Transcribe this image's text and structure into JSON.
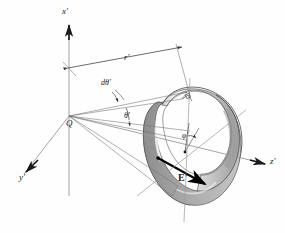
{
  "figure": {
    "background_color": "#fefefe",
    "line_color": "#4a4a4a",
    "dark_color": "#111111"
  },
  "axes": {
    "x_label": "x'",
    "y_label": "y'",
    "z_label": "z'",
    "origin_label": "Q"
  },
  "annotations": {
    "radius_label": "r'",
    "dtheta_label": "dθ'",
    "theta_label": "θ'",
    "phi_label": "φ'",
    "field_label": "E'"
  },
  "shading": {
    "band_light": "#f2f2f2",
    "band_mid": "#d9d9d9",
    "band_dark": "#a8a8a8",
    "band_darker": "#8f8f8f",
    "highlight": "#fbfbfb"
  }
}
